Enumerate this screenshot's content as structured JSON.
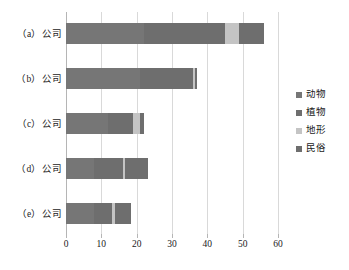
{
  "chart_data": {
    "type": "bar",
    "orientation": "horizontal",
    "stacked": true,
    "title": "",
    "xlabel": "",
    "ylabel": "",
    "xlim": [
      0,
      60
    ],
    "xticks": [
      0,
      10,
      20,
      30,
      40,
      50,
      60
    ],
    "xtick_labels": [
      "0",
      "10",
      "20",
      "30",
      "40",
      "50",
      "60"
    ],
    "grid": "vertical",
    "legend_position": "right",
    "categories": [
      "（a）公司",
      "（b）公司",
      "（c）公司",
      "（d）公司",
      "（e）公司"
    ],
    "series": [
      {
        "name": "动物",
        "color": "#767676",
        "values": [
          22,
          21,
          12,
          8,
          8
        ]
      },
      {
        "name": "植物",
        "color": "#6e6e6e",
        "values": [
          23,
          15,
          7,
          8,
          5
        ]
      },
      {
        "name": "地形",
        "color": "#c4c4c4",
        "values": [
          4,
          0.6,
          2,
          0.8,
          0.8
        ]
      },
      {
        "name": "民俗",
        "color": "#6e6e6e",
        "values": [
          7,
          0.6,
          1,
          6.5,
          4.5
        ]
      }
    ],
    "totals": [
      56,
      37.2,
      22,
      23.3,
      18.3
    ]
  },
  "legend": {
    "items": [
      {
        "label": "动物",
        "color": "#767676"
      },
      {
        "label": "植物",
        "color": "#6e6e6e"
      },
      {
        "label": "地形",
        "color": "#c4c4c4"
      },
      {
        "label": "民俗",
        "color": "#6e6e6e"
      }
    ]
  },
  "colors": {
    "gridline": "#d9d9d9",
    "axis": "#b5b5b5",
    "text": "#1a1a1a",
    "background": "#ffffff"
  }
}
